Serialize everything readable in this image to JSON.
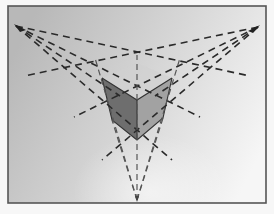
{
  "image": {
    "description": "Photograph of a three-point perspective drawing: a cube viewed from above with dashed construction lines converging to three vanishing points",
    "frame": {
      "x": 8,
      "y": 6,
      "width": 258,
      "height": 197,
      "border_color": "#555555"
    },
    "background_gradient": [
      "#b4b4b4",
      "#d8d8d8",
      "#f4f4f4"
    ],
    "vanishing_points": {
      "left": {
        "x": 16,
        "y": 26
      },
      "right": {
        "x": 258,
        "y": 27
      },
      "bottom": {
        "x": 137,
        "y": 200
      }
    },
    "cube": {
      "vertices": {
        "top_back": [
          137,
          63
        ],
        "top_left": [
          102,
          78
        ],
        "top_right": [
          172,
          78
        ],
        "top_front": [
          137,
          100
        ],
        "bottom_left": [
          112,
          120
        ],
        "bottom_right": [
          163,
          118
        ],
        "bottom_front": [
          137,
          140
        ]
      },
      "left_face_color": "#6a6a6a",
      "right_face_color": "#9a9a9a",
      "top_face_color": "#d4d4d4"
    },
    "line_color": "#2a2a2a"
  }
}
